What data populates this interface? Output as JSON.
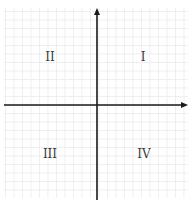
{
  "diagram": {
    "type": "cartesian-plane-quadrants",
    "axis_color": "#1a1a1a",
    "grid_color": "#eeeeee",
    "label_color": "#3a3a3a",
    "quadrants": [
      {
        "id": "q1",
        "label": "I",
        "position": "upper-right"
      },
      {
        "id": "q2",
        "label": "II",
        "position": "upper-left"
      },
      {
        "id": "q3",
        "label": "III",
        "position": "lower-left"
      },
      {
        "id": "q4",
        "label": "IV",
        "position": "lower-right"
      }
    ]
  }
}
